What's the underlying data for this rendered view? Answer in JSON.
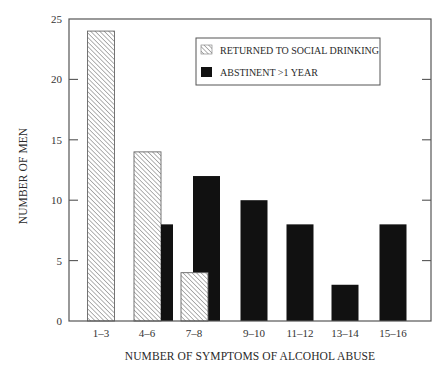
{
  "chart_data": {
    "type": "bar",
    "title": "",
    "xlabel": "NUMBER OF SYMPTOMS OF ALCOHOL ABUSE",
    "ylabel": "NUMBER OF MEN",
    "categories": [
      "1–3",
      "4–6",
      "7–8",
      "9–10",
      "11–12",
      "13–14",
      "15–16"
    ],
    "series": [
      {
        "name": "RETURNED TO SOCIAL DRINKING",
        "style": "hatched",
        "color": "#9a9a9a",
        "values": [
          24,
          14,
          4,
          0,
          0,
          0,
          0
        ]
      },
      {
        "name": "ABSTINENT >1 YEAR",
        "style": "solid",
        "color": "#111111",
        "values": [
          0,
          8,
          12,
          10,
          8,
          3,
          8
        ]
      }
    ],
    "ylim": [
      0,
      25
    ],
    "yticks": [
      0,
      5,
      10,
      15,
      20,
      25
    ],
    "grid": false,
    "legend_position": "upper-right-inside"
  },
  "legend": {
    "items": [
      {
        "label": "RETURNED TO SOCIAL DRINKING"
      },
      {
        "label": "ABSTINENT >1 YEAR"
      }
    ]
  },
  "colors": {
    "frame": "#555555",
    "solid_bar": "#111111",
    "hatch_line": "#8a8a8a"
  }
}
